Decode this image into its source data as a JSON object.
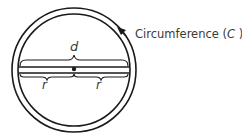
{
  "diagram": {
    "labels": {
      "circumference": "Circumference (",
      "circumference_symbol": "C",
      "circumference_close": " )",
      "diameter": "d",
      "radius_left": "r",
      "radius_right": "r"
    },
    "colors": {
      "stroke": "#1a1a1a",
      "text": "#3a3a3a"
    }
  }
}
